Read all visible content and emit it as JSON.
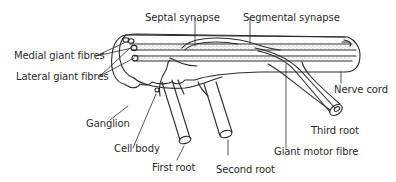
{
  "diagram": {
    "labels": {
      "septal_synapse": "Septal synapse",
      "segmental_synapse": "Segmental synapse",
      "medial_giant_fibres": "Medial giant fibres",
      "lateral_giant_fibres": "Lateral giant fibres",
      "nerve_cord": "Nerve cord",
      "ganglion": "Ganglion",
      "cell_body": "Cell body",
      "third_root": "Third root",
      "first_root": "First root",
      "second_root": "Second root",
      "giant_motor_fibre": "Giant motor fibre"
    },
    "colors": {
      "line": "#2a2a2a",
      "stipple": "#9a9a9a",
      "background": "#ffffff"
    }
  }
}
